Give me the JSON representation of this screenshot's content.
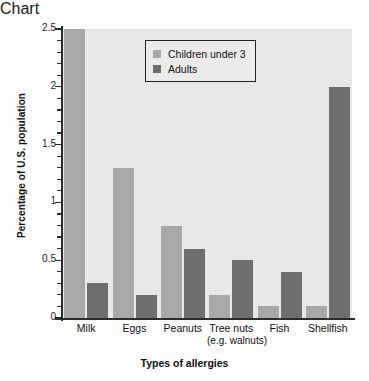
{
  "chart_data": {
    "type": "bar",
    "title": "",
    "xlabel": "Types of allergies",
    "ylabel": "Percentage of U.S. population",
    "categories": [
      "Milk",
      "Eggs",
      "Peanuts",
      "Tree nuts",
      "Fish",
      "Shellfish"
    ],
    "category_sublabels": [
      "",
      "",
      "",
      "(e.g. walnuts)",
      "",
      ""
    ],
    "series": [
      {
        "name": "Children under 3",
        "values": [
          2.5,
          1.3,
          0.8,
          0.2,
          0.1,
          0.1
        ],
        "color": "#a8a8a8"
      },
      {
        "name": "Adults",
        "values": [
          0.3,
          0.2,
          0.6,
          0.5,
          0.4,
          2.0
        ],
        "color": "#6e6e6e"
      }
    ],
    "ylim": [
      0,
      2.5
    ],
    "ytick_labels": [
      "0",
      "0.5",
      "1",
      "1.5",
      "2",
      "2.5"
    ],
    "ytick_values": [
      0,
      0.5,
      1,
      1.5,
      2,
      2.5
    ],
    "yminor_step": 0.1,
    "grid": false,
    "legend_position": "top-center",
    "plot_background": "#e8e8e8"
  },
  "legend": {
    "items": [
      {
        "label": "Children under 3",
        "swatch": "child"
      },
      {
        "label": "Adults",
        "swatch": "adult"
      }
    ]
  }
}
